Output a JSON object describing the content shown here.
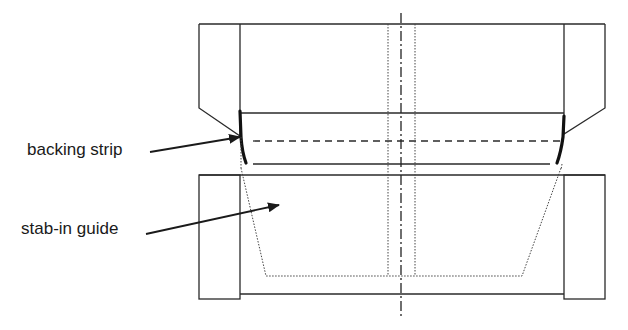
{
  "diagram": {
    "type": "mechanical cross-section",
    "labels": [
      {
        "id": "backing-strip",
        "text": "backing strip"
      },
      {
        "id": "stab-in-guide",
        "text": "stab-in guide"
      }
    ],
    "line_color": "#222222",
    "background": "#ffffff"
  }
}
